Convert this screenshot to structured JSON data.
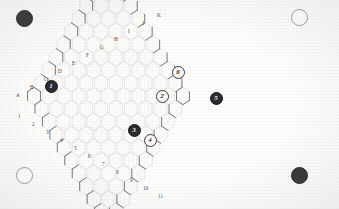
{
  "board": {
    "title": "Hexagonal game board",
    "grid_type": "pointy-top hexagon rhombus",
    "hex_fill": "#fbfbfa",
    "hex_stroke": "#d8d8da",
    "outline_stroke": "#6f6f78",
    "background": "#fdfdfc",
    "rows": 11,
    "cols": 11
  },
  "edge_labels": {
    "letters": [
      {
        "text": "A",
        "x": 16,
        "y": 93
      },
      {
        "text": "B",
        "x": 30,
        "y": 85
      },
      {
        "text": "C",
        "x": 44,
        "y": 77
      },
      {
        "text": "D",
        "x": 58,
        "y": 69
      },
      {
        "text": "E",
        "x": 72,
        "y": 61
      },
      {
        "text": "F",
        "x": 86,
        "y": 53
      },
      {
        "text": "G",
        "x": 100,
        "y": 45
      },
      {
        "text": "H",
        "x": 114,
        "y": 37
      },
      {
        "text": "I",
        "x": 128,
        "y": 29
      },
      {
        "text": "J",
        "x": 142,
        "y": 21
      },
      {
        "text": "K",
        "x": 157,
        "y": 13
      }
    ],
    "numbers": [
      {
        "text": "1",
        "x": 18,
        "y": 114
      },
      {
        "text": "2",
        "x": 32,
        "y": 122
      },
      {
        "text": "3",
        "x": 46,
        "y": 130
      },
      {
        "text": "4",
        "x": 60,
        "y": 138
      },
      {
        "text": "5",
        "x": 74,
        "y": 146
      },
      {
        "text": "6",
        "x": 88,
        "y": 154
      },
      {
        "text": "7",
        "x": 102,
        "y": 162
      },
      {
        "text": "8",
        "x": 116,
        "y": 170
      },
      {
        "text": "9",
        "x": 130,
        "y": 178
      },
      {
        "text": "10",
        "x": 143,
        "y": 186
      },
      {
        "text": "11",
        "x": 158,
        "y": 194
      }
    ]
  },
  "pieces": [
    {
      "label": "1",
      "color": "dark",
      "x": 51,
      "y": 86,
      "size": 13
    },
    {
      "label": "2",
      "color": "light",
      "x": 162,
      "y": 96,
      "size": 13
    },
    {
      "label": "3",
      "color": "dark",
      "x": 134,
      "y": 130,
      "size": 13
    },
    {
      "label": "4",
      "color": "light",
      "x": 150,
      "y": 140,
      "size": 13
    },
    {
      "label": "5",
      "color": "dark",
      "x": 216,
      "y": 98,
      "size": 13
    },
    {
      "label": "6",
      "color": "light",
      "x": 178,
      "y": 72,
      "size": 13
    }
  ],
  "corner_markers": [
    {
      "position": "top-left",
      "color": "dark",
      "x": 24,
      "y": 18,
      "size": 17
    },
    {
      "position": "top-right",
      "color": "light",
      "x": 299,
      "y": 17,
      "size": 17
    },
    {
      "position": "bottom-left",
      "color": "light",
      "x": 24,
      "y": 175,
      "size": 17
    },
    {
      "position": "bottom-right",
      "color": "dark",
      "x": 299,
      "y": 175,
      "size": 17
    }
  ]
}
